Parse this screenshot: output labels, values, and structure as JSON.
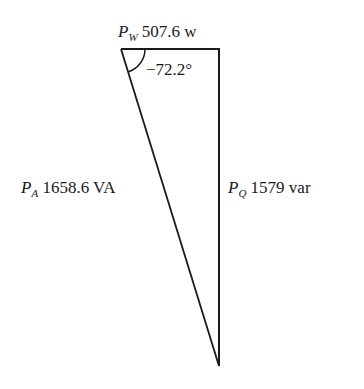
{
  "diagram": {
    "type": "power-triangle",
    "real_power": {
      "symbol": "P",
      "subscript": "W",
      "value": "507.6 w"
    },
    "reactive_power": {
      "symbol": "P",
      "subscript": "Q",
      "value": "1579 var"
    },
    "apparent_power": {
      "symbol": "P",
      "subscript": "A",
      "value": "1658.6 VA"
    },
    "angle": {
      "value": "−72.2°"
    }
  },
  "colors": {
    "line": "#1a1a1a",
    "text": "#1a1a1a",
    "background": "#ffffff"
  }
}
